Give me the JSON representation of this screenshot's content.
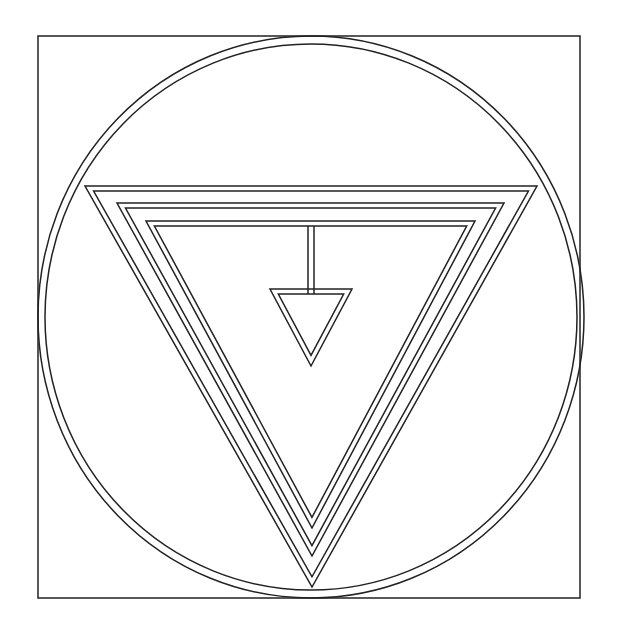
{
  "diagram": {
    "type": "geometric-symbol",
    "colors": {
      "background": "#ffffff",
      "stroke": "#222222"
    },
    "frame": {
      "x": 38,
      "y": 36,
      "width": 542,
      "height": 562
    },
    "circle": {
      "cx": 311,
      "cy": 317,
      "rx_outer": 273,
      "ry_outer": 281,
      "rx_inner": 266,
      "ry_inner": 273
    },
    "triangles": [
      {
        "name": "outer",
        "left": [
          85,
          186
        ],
        "right": [
          537,
          186
        ],
        "apex": [
          312,
          587
        ],
        "gap": 5
      },
      {
        "name": "middle",
        "left": [
          117,
          203
        ],
        "right": [
          504,
          203
        ],
        "apex": [
          312,
          556
        ],
        "gap": 5
      },
      {
        "name": "inner",
        "left": [
          146,
          221
        ],
        "right": [
          475,
          221
        ],
        "apex": [
          312,
          528
        ],
        "gap": 5
      }
    ],
    "pendant": {
      "stem": {
        "x1": 308,
        "x2": 314,
        "y_top": 226,
        "y_bottom": 289
      },
      "triangle": {
        "left": [
          270,
          289
        ],
        "right": [
          352,
          289
        ],
        "apex": [
          311,
          366
        ],
        "gap": 5
      }
    }
  }
}
